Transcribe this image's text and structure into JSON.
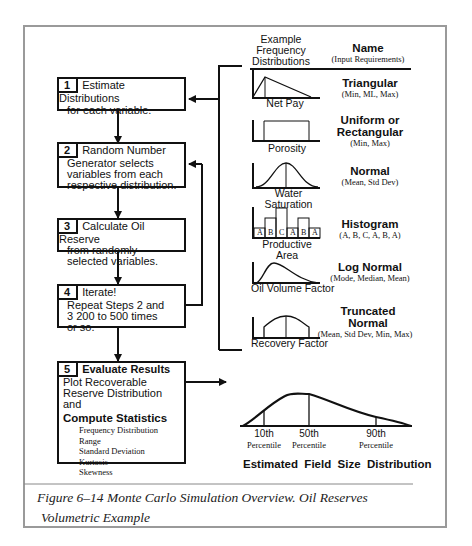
{
  "header": {
    "example_col": [
      "Example",
      "Frequency",
      "Distributions"
    ],
    "name_col": "Name",
    "name_sub": "(Input Requirements)"
  },
  "steps": [
    {
      "num": "1",
      "title": "Estimate Distributions",
      "body": "for each variable."
    },
    {
      "num": "2",
      "title": "Random Number",
      "body": "Generator selects variables from each respective distribution."
    },
    {
      "num": "3",
      "title": "Calculate Oil Reserve",
      "body": "from randomly selected variables."
    },
    {
      "num": "4",
      "title": "Iterate!",
      "body": "Repeat Steps 2 and 3 200 to 500 times or so."
    },
    {
      "num": "5",
      "title": "Evaluate Results",
      "body": "Plot Recoverable Reserve Distribution and",
      "subtitle": "Compute Statistics",
      "stats": [
        "Frequency Distribution",
        "Range",
        "Standard Deviation",
        "Kurtosis",
        "Skewness"
      ]
    }
  ],
  "distributions": [
    {
      "variable": "Net Pay",
      "name": "Triangular",
      "inputs": "(Min, ML, Max)",
      "shape": "triangular"
    },
    {
      "variable": "Porosity",
      "name": "Uniform  or",
      "name2": "Rectangular",
      "inputs": "(Min, Max)",
      "shape": "uniform"
    },
    {
      "variable": "Water Saturation",
      "name": "Normal",
      "inputs": "(Mean, Std Dev)",
      "shape": "normal"
    },
    {
      "variable": "Productive  Area",
      "name": "Histogram",
      "inputs": "(A, B, C, A, B, A)",
      "shape": "histogram",
      "bins": [
        "A",
        "B",
        "C",
        "A",
        "B",
        "A"
      ]
    },
    {
      "variable": "Oil Volume Factor",
      "name": "Log  Normal",
      "inputs": "(Mode, Median, Mean)",
      "shape": "lognormal"
    },
    {
      "variable": "Recovery Factor",
      "name": "Truncated",
      "name2": "Normal",
      "inputs": "(Mean, Std Dev, Min, Max)",
      "shape": "truncated-normal"
    }
  ],
  "result": {
    "percentiles": [
      {
        "value": "10th",
        "label": "Percentile"
      },
      {
        "value": "50th",
        "label": "Percentile"
      },
      {
        "value": "90th",
        "label": "Percentile"
      }
    ],
    "title": "Estimated  Field  Size  Distribution"
  },
  "caption": {
    "line1": "Figure 6–14 Monte Carlo Simulation Overview. Oil Reserves",
    "line2": "Volumetric Example"
  }
}
